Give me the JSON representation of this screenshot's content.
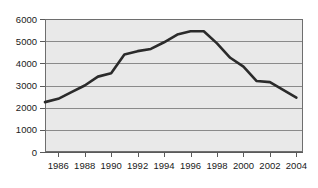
{
  "chart_data": {
    "type": "line",
    "title": "",
    "subtitle": "",
    "xlabel": "",
    "ylabel": "",
    "xlim": [
      1985,
      2004.5
    ],
    "ylim": [
      0,
      6000
    ],
    "grid": true,
    "legend": false,
    "legend_position": "none",
    "y_ticks": [
      0,
      1000,
      2000,
      3000,
      4000,
      5000,
      6000
    ],
    "y_tick_labels": [
      "0",
      "1000",
      "2000",
      "3000",
      "4000",
      "5000",
      "6000"
    ],
    "x_ticks": [
      1986,
      1988,
      1990,
      1992,
      1994,
      1996,
      1998,
      2000,
      2002,
      2004
    ],
    "x_tick_labels": [
      "1986",
      "1988",
      "1990",
      "1992",
      "1994",
      "1996",
      "1998",
      "2000",
      "2002",
      "2004"
    ],
    "series": [
      {
        "name": "series-1",
        "color": "#2b2b2b",
        "x": [
          1985,
          1986,
          1987,
          1988,
          1989,
          1990,
          1991,
          1992,
          1993,
          1994,
          1995,
          1996,
          1997,
          1998,
          1999,
          2000,
          2001,
          2002,
          2003,
          2004
        ],
        "values": [
          2250,
          2400,
          2700,
          3000,
          3400,
          3550,
          4400,
          4550,
          4650,
          4950,
          5300,
          5450,
          5450,
          4900,
          4250,
          3850,
          3200,
          3150,
          2800,
          2450
        ]
      }
    ]
  },
  "plot_style": {
    "background": "#e9e9e9",
    "gridline_color": "#8a8a8a",
    "axis_color": "#5a5a5a",
    "line_color": "#2b2b2b",
    "page_background": "#ffffff"
  }
}
